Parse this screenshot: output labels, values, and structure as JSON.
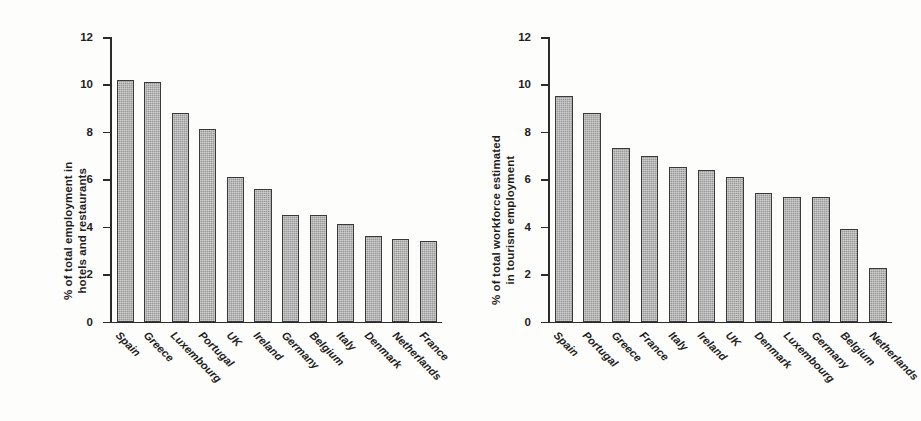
{
  "chart_data": [
    {
      "id": "left",
      "type": "bar",
      "title": "",
      "xlabel": "",
      "ylabel": "% of total employment in hotels and restaurants",
      "ylabel_lines": [
        "% of total employment in",
        "hotels and restaurants"
      ],
      "ylim": [
        0,
        12
      ],
      "yticks": [
        12,
        10,
        8,
        6,
        4,
        2,
        0
      ],
      "ytick_labels": [
        "12",
        "10",
        "8",
        "6",
        "4",
        "2",
        "0"
      ],
      "grid": false,
      "legend": "none",
      "categories": [
        "Spain",
        "Greece",
        "Luxembourg",
        "Portugal",
        "UK",
        "Ireland",
        "Germany",
        "Belgium",
        "Italy",
        "Denmark",
        "Netherlands",
        "France"
      ],
      "values": [
        10.2,
        10.1,
        8.8,
        8.1,
        6.1,
        5.6,
        4.5,
        4.5,
        4.1,
        3.6,
        3.5,
        3.4
      ]
    },
    {
      "id": "right",
      "type": "bar",
      "title": "",
      "xlabel": "",
      "ylabel": "% of total workforce estimated in tourism employment",
      "ylabel_lines": [
        "% of total workforce estimated",
        "in tourism employment"
      ],
      "ylim": [
        0,
        12
      ],
      "yticks": [
        12,
        10,
        8,
        6,
        4,
        2,
        0
      ],
      "ytick_labels": [
        "12",
        "10",
        "8",
        "6",
        "4",
        "2",
        "0"
      ],
      "grid": false,
      "legend": "none",
      "categories": [
        "Spain",
        "Portugal",
        "Greece",
        "France",
        "Italy",
        "Ireland",
        "UK",
        "Denmark",
        "Luxembourg",
        "Germany",
        "Belgium",
        "Netherlands"
      ],
      "values": [
        9.5,
        8.8,
        7.3,
        7.0,
        6.5,
        6.4,
        6.1,
        5.4,
        5.25,
        5.25,
        3.9,
        2.25
      ]
    }
  ],
  "style": {
    "bar_fill": "#9b9b9b",
    "bar_border": "#3a3a3a",
    "axis_color": "#2b2b2b",
    "text_color": "#1f1f1f",
    "background": "#fdfdfc"
  }
}
